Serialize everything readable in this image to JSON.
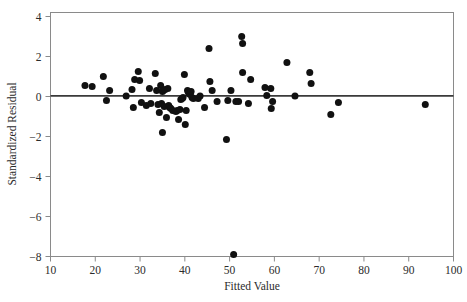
{
  "figure": {
    "title": "",
    "background_color": "#ffffff",
    "frame_color": "#8a8a8a",
    "point_color": "#111111",
    "reference_line_color": "#3a3a3a"
  },
  "axes": {
    "x_title": "Fitted Value",
    "y_title": "Standardized Residual",
    "x_ticks": [
      "10",
      "20",
      "30",
      "40",
      "50",
      "60",
      "70",
      "80",
      "90",
      "100"
    ],
    "y_ticks": [
      "4",
      "2",
      "0",
      "−2",
      "−4",
      "−6",
      "−8"
    ]
  },
  "chart_data": {
    "type": "scatter",
    "title": "",
    "xlabel": "Fitted Value",
    "ylabel": "Standardized Residual",
    "xlim": [
      10,
      100
    ],
    "ylim": [
      -8.8,
      4.2
    ],
    "xticks": [
      10,
      20,
      30,
      40,
      50,
      60,
      70,
      80,
      90,
      100
    ],
    "yticks": [
      4,
      2,
      0,
      -2,
      -4,
      -6,
      -8
    ],
    "grid": false,
    "legend": null,
    "reference_line": {
      "type": "horizontal",
      "y": 0.03,
      "label": "zero residual line"
    },
    "marker": {
      "shape": "circle",
      "size": 4.6,
      "color": "#111111"
    },
    "points": [
      {
        "x": 17.7,
        "y": 0.55
      },
      {
        "x": 19.3,
        "y": 0.5
      },
      {
        "x": 21.8,
        "y": 1.0
      },
      {
        "x": 22.5,
        "y": -0.2
      },
      {
        "x": 23.2,
        "y": 0.3
      },
      {
        "x": 26.9,
        "y": 0.02
      },
      {
        "x": 28.2,
        "y": 0.35
      },
      {
        "x": 28.5,
        "y": -0.55
      },
      {
        "x": 28.8,
        "y": 0.85
      },
      {
        "x": 29.6,
        "y": 1.25
      },
      {
        "x": 29.9,
        "y": 0.8
      },
      {
        "x": 30.3,
        "y": -0.3
      },
      {
        "x": 31.4,
        "y": -0.45
      },
      {
        "x": 32.1,
        "y": 0.4
      },
      {
        "x": 32.4,
        "y": -0.35
      },
      {
        "x": 33.4,
        "y": 1.15
      },
      {
        "x": 33.7,
        "y": 0.3
      },
      {
        "x": 34.0,
        "y": -0.4
      },
      {
        "x": 34.3,
        "y": -0.8
      },
      {
        "x": 34.6,
        "y": 0.55
      },
      {
        "x": 34.8,
        "y": -0.35
      },
      {
        "x": 35.0,
        "y": 0.25
      },
      {
        "x": 35.0,
        "y": -1.8
      },
      {
        "x": 35.2,
        "y": 0.3
      },
      {
        "x": 35.4,
        "y": -0.5
      },
      {
        "x": 35.6,
        "y": 0.35
      },
      {
        "x": 35.9,
        "y": -1.05
      },
      {
        "x": 36.2,
        "y": 0.4
      },
      {
        "x": 36.4,
        "y": -0.45
      },
      {
        "x": 36.6,
        "y": -0.55
      },
      {
        "x": 36.9,
        "y": -0.6
      },
      {
        "x": 37.3,
        "y": -0.7
      },
      {
        "x": 38.0,
        "y": -0.75
      },
      {
        "x": 38.3,
        "y": -0.7
      },
      {
        "x": 38.6,
        "y": -1.15
      },
      {
        "x": 38.9,
        "y": -0.65
      },
      {
        "x": 39.1,
        "y": -0.15
      },
      {
        "x": 39.4,
        "y": -0.1
      },
      {
        "x": 39.6,
        "y": -0.05
      },
      {
        "x": 39.9,
        "y": 1.1
      },
      {
        "x": 40.1,
        "y": -1.4
      },
      {
        "x": 40.3,
        "y": -0.7
      },
      {
        "x": 40.6,
        "y": 0.3
      },
      {
        "x": 40.8,
        "y": 0.2
      },
      {
        "x": 41.0,
        "y": 0.15
      },
      {
        "x": 41.2,
        "y": 0.1
      },
      {
        "x": 41.4,
        "y": 0.25
      },
      {
        "x": 41.6,
        "y": -0.05
      },
      {
        "x": 41.9,
        "y": -0.1
      },
      {
        "x": 43.0,
        "y": -0.1
      },
      {
        "x": 43.4,
        "y": 0.02
      },
      {
        "x": 44.4,
        "y": -0.55
      },
      {
        "x": 45.4,
        "y": 2.4
      },
      {
        "x": 45.6,
        "y": 0.75
      },
      {
        "x": 46.1,
        "y": 0.3
      },
      {
        "x": 47.2,
        "y": -0.25
      },
      {
        "x": 49.3,
        "y": -2.15
      },
      {
        "x": 49.6,
        "y": -0.2
      },
      {
        "x": 50.3,
        "y": 0.3
      },
      {
        "x": 50.9,
        "y": -7.9
      },
      {
        "x": 51.4,
        "y": -0.25
      },
      {
        "x": 52.0,
        "y": -0.25
      },
      {
        "x": 52.7,
        "y": 3.0
      },
      {
        "x": 52.9,
        "y": 2.65
      },
      {
        "x": 52.9,
        "y": 1.2
      },
      {
        "x": 54.2,
        "y": -0.35
      },
      {
        "x": 54.7,
        "y": 0.85
      },
      {
        "x": 57.9,
        "y": 0.45
      },
      {
        "x": 58.3,
        "y": 0.05
      },
      {
        "x": 59.2,
        "y": 0.4
      },
      {
        "x": 59.3,
        "y": -0.6
      },
      {
        "x": 59.6,
        "y": -0.25
      },
      {
        "x": 62.8,
        "y": 1.7
      },
      {
        "x": 64.6,
        "y": 0.02
      },
      {
        "x": 67.9,
        "y": 1.2
      },
      {
        "x": 68.2,
        "y": 0.65
      },
      {
        "x": 72.6,
        "y": -0.9
      },
      {
        "x": 74.3,
        "y": -0.3
      },
      {
        "x": 93.7,
        "y": -0.4
      }
    ]
  }
}
